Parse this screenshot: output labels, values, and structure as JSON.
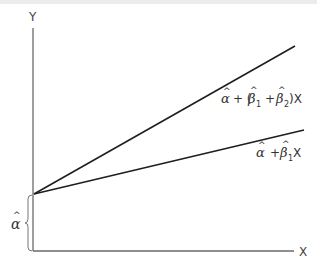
{
  "diagram": {
    "axes": {
      "y_label": "Y",
      "x_label": "X"
    },
    "intercept_label": {
      "symbol": "α",
      "hat": "^"
    },
    "lines": [
      {
        "name": "steeper-line",
        "label_parts": {
          "alpha": "α",
          "plus1": "+ (",
          "beta": "β",
          "sub1": "1",
          "plus2": "+",
          "beta2": "β",
          "sub2": "2",
          "close": ")X"
        },
        "label_text": "α̂ + (β̂1 + β̂2)X"
      },
      {
        "name": "flatter-line",
        "label_parts": {
          "alpha": "α",
          "plus": "+",
          "beta": "β",
          "sub1": "1",
          "x": "X"
        },
        "label_text": "α̂ + β̂1X"
      }
    ],
    "colors": {
      "axis": "#6a6a6a",
      "line": "#1f1f1f",
      "text": "#333333"
    }
  }
}
